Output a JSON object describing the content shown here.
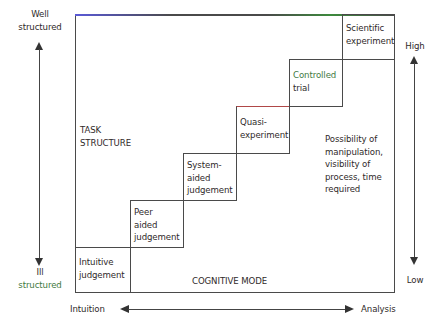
{
  "diagram": {
    "left_axis": {
      "top_label": "Well structured",
      "top_label_line1": "Well",
      "top_label_line2": "structured",
      "bottom_label_line1": "Ill",
      "bottom_label_line2": "structured"
    },
    "right_axis": {
      "top_label": "High",
      "bottom_label": "Low"
    },
    "bottom_axis": {
      "left_label": "Intuition",
      "right_label": "Analysis"
    },
    "region_labels": {
      "task_structure_line1": "TASK",
      "task_structure_line2": "STRUCTURE",
      "cognitive_mode": "COGNITIVE MODE",
      "possibility_lines": [
        "Possibility of",
        "manipulation,",
        "visibility of",
        "process, time",
        "required"
      ]
    },
    "steps": [
      {
        "lines": [
          "Intuitive",
          "judgement"
        ]
      },
      {
        "lines": [
          "Peer",
          "aided",
          "judgement"
        ]
      },
      {
        "lines": [
          "System-",
          "aided",
          "judgement"
        ]
      },
      {
        "lines": [
          "Quasi-",
          "experiment"
        ]
      },
      {
        "lines": [
          "Controlled",
          "trial"
        ]
      },
      {
        "lines": [
          "Scientific",
          "experiment"
        ]
      }
    ],
    "colors": {
      "line": "#4a4a4a",
      "text": "#2f2a2a",
      "accent_green": "#3f7a3f",
      "accent_red": "#b04848"
    }
  }
}
